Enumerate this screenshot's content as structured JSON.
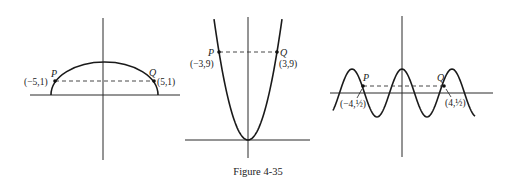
{
  "caption": "Figure 4-35",
  "panels": [
    {
      "id": "semi-ellipse",
      "description": "Upper half of an ellipse symmetric about the y-axis",
      "points": [
        {
          "name": "P",
          "coord_label": "(−5,1)",
          "x": -5,
          "y": 1
        },
        {
          "name": "Q",
          "coord_label": "(5,1)",
          "x": 5,
          "y": 1
        }
      ]
    },
    {
      "id": "parabola",
      "description": "Parabola y = x²",
      "points": [
        {
          "name": "P",
          "coord_label": "(−3,9)",
          "x": -3,
          "y": 9
        },
        {
          "name": "Q",
          "coord_label": "(3,9)",
          "x": 3,
          "y": 9
        }
      ]
    },
    {
      "id": "cosine-wave",
      "description": "Cosine-like periodic curve symmetric about the y-axis",
      "points": [
        {
          "name": "P",
          "coord_label": "(−4,½)",
          "x": -4,
          "y": 0.5
        },
        {
          "name": "Q",
          "coord_label": "(4,½)",
          "x": 4,
          "y": 0.5
        }
      ]
    }
  ]
}
